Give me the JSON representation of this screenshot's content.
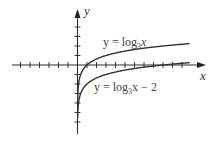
{
  "chart_data": {
    "type": "line",
    "title": "",
    "xlabel": "x",
    "ylabel": "y",
    "xlim": [
      -6.5,
      12
    ],
    "ylim": [
      -7,
      5.8
    ],
    "grid": false,
    "x_ticks_unit": 1,
    "y_ticks_unit": 1,
    "x_tick_range": [
      -6,
      12
    ],
    "y_tick_range": [
      -6,
      4
    ],
    "legend": "inline labels",
    "series": [
      {
        "name": "y = log3x",
        "label_main": "y = log",
        "label_sub": "3",
        "label_tail": "x",
        "function": "log3(x)",
        "x_domain": [
          0.02,
          11.8
        ],
        "samples": [
          [
            0.05,
            -2.73
          ],
          [
            0.1,
            -2.1
          ],
          [
            0.333,
            -1
          ],
          [
            1,
            0
          ],
          [
            3,
            1
          ],
          [
            9,
            2
          ],
          [
            11.8,
            2.25
          ]
        ]
      },
      {
        "name": "y = log3x − 2",
        "label_main": "y = log",
        "label_sub": "3",
        "label_tail": "x − 2",
        "function": "log3(x) - 2",
        "x_domain": [
          0.02,
          11.8
        ],
        "samples": [
          [
            0.05,
            -4.73
          ],
          [
            0.1,
            -4.1
          ],
          [
            0.333,
            -3
          ],
          [
            1,
            -2
          ],
          [
            3,
            -1
          ],
          [
            9,
            0
          ],
          [
            11.8,
            0.25
          ]
        ]
      }
    ],
    "annotations": [
      {
        "text": "y = log3x",
        "position": "above upper curve"
      },
      {
        "text": "y = log3x − 2",
        "position": "below lower curve"
      }
    ]
  },
  "axes": {
    "x_label": "x",
    "y_label": "y"
  },
  "labels": {
    "upper": {
      "main": "y = log",
      "sub": "3",
      "tail": "x"
    },
    "lower": {
      "main": "y = log",
      "sub": "3",
      "tail": "x − 2"
    }
  },
  "colors": {
    "axis": "#2a2a2a",
    "curve": "#333333",
    "text": "#444444"
  }
}
